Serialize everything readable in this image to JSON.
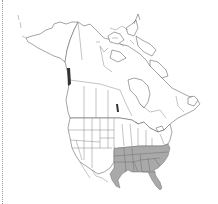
{
  "map": {
    "type": "range-distribution-map",
    "region": "North America",
    "shaded_color": "#a9a9a9",
    "outline_color": "#5a5a5a",
    "background_color": "#ffffff",
    "shaded_states": [
      "Texas (east)",
      "Oklahoma (east)",
      "Arkansas",
      "Louisiana",
      "Mississippi",
      "Alabama",
      "Georgia",
      "Florida",
      "South Carolina",
      "North Carolina",
      "Tennessee",
      "Kentucky",
      "Virginia",
      "Missouri (south)"
    ]
  }
}
